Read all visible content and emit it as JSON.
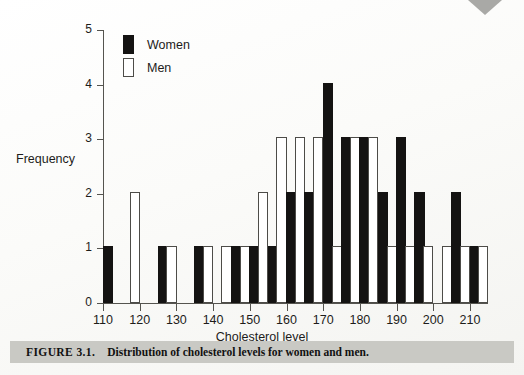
{
  "figure": {
    "number_label": "FIGURE 3.1.",
    "caption": "Distribution of cholesterol levels for women and men."
  },
  "legend": {
    "position": "top-left-inside",
    "entries": [
      {
        "label": "Women",
        "swatch": "filled-black-bar",
        "color": "#141312"
      },
      {
        "label": "Men",
        "swatch": "outlined-white-bar",
        "color": "#ffffff"
      }
    ]
  },
  "axes": {
    "y_title": "Frequency",
    "x_title": "Cholesterol level",
    "y_ticks": [
      "0",
      "1",
      "2",
      "3",
      "4",
      "5"
    ],
    "x_ticks": [
      "110",
      "120",
      "130",
      "140",
      "150",
      "160",
      "170",
      "180",
      "190",
      "200",
      "210"
    ]
  },
  "chart_data": {
    "type": "bar",
    "title": "Distribution of cholesterol levels for women and men",
    "xlabel": "Cholesterol level",
    "ylabel": "Frequency",
    "xlim": [
      108,
      217
    ],
    "ylim": [
      0,
      5
    ],
    "grid": false,
    "legend_position": "upper left",
    "bin_width": 5,
    "categories": [
      110,
      115,
      120,
      125,
      130,
      135,
      140,
      145,
      150,
      155,
      160,
      165,
      170,
      175,
      180,
      185,
      190,
      195,
      200,
      205,
      210
    ],
    "series": [
      {
        "name": "Women",
        "color": "#141312",
        "values": [
          1,
          0,
          0,
          1,
          0,
          1,
          0,
          1,
          1,
          1,
          2,
          2,
          4,
          3,
          3,
          2,
          3,
          2,
          0,
          2,
          1
        ]
      },
      {
        "name": "Men",
        "color": "#ffffff",
        "values": [
          0,
          2,
          0,
          1,
          0,
          1,
          1,
          1,
          2,
          3,
          3,
          3,
          1,
          3,
          3,
          1,
          1,
          1,
          1,
          1,
          1
        ]
      }
    ]
  }
}
